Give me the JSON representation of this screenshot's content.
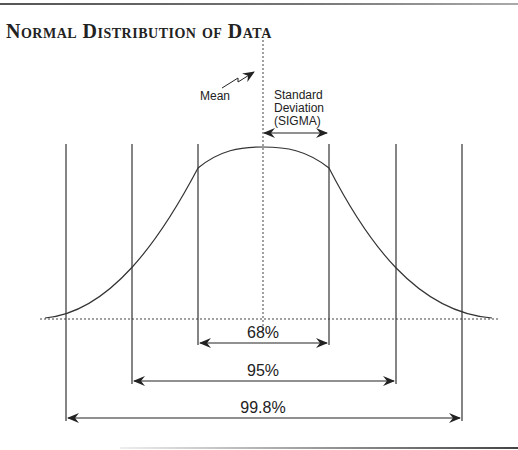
{
  "figure": {
    "caption": "FIGURE 5.1",
    "title": "Normal Distribution of Data"
  },
  "annotations": {
    "mean_label": "Mean",
    "sigma_label_line1": "Standard",
    "sigma_label_line2": "Deviation",
    "sigma_label_line3": "(SIGMA)"
  },
  "ranges": [
    {
      "label": "68%",
      "sigma": 1
    },
    {
      "label": "95%",
      "sigma": 2
    },
    {
      "label": "99.8%",
      "sigma": 3
    }
  ],
  "colors": {
    "line": "#333333",
    "text": "#222222",
    "background": "#ffffff"
  }
}
